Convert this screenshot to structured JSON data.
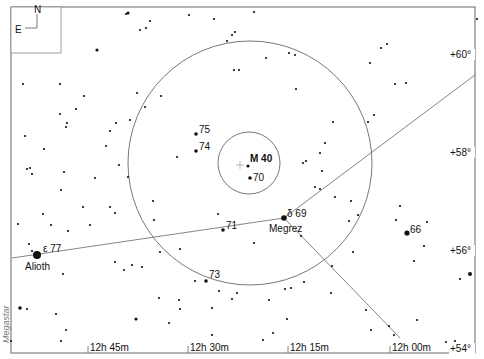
{
  "chart_data": {
    "type": "scatter",
    "compass": {
      "north": "N",
      "east": "E"
    },
    "ra_ticks": [
      {
        "label": "12h 45m",
        "x": 88
      },
      {
        "label": "12h 30m",
        "x": 188
      },
      {
        "label": "12h 15m",
        "x": 288
      },
      {
        "label": "12h 00m",
        "x": 390
      }
    ],
    "dec_ticks": [
      {
        "label": "+60°",
        "y": 55
      },
      {
        "label": "+58°",
        "y": 153
      },
      {
        "label": "+56°",
        "y": 251
      },
      {
        "label": "+54°",
        "y": 349
      }
    ],
    "fov_circles": [
      {
        "cx": 250,
        "cy": 163,
        "r": 122
      },
      {
        "cx": 249,
        "cy": 163,
        "r": 31
      }
    ],
    "center_marker": {
      "x": 240,
      "y": 165
    },
    "lines": [
      {
        "x1": 12,
        "y1": 258,
        "x2": 284,
        "y2": 218
      },
      {
        "x1": 284,
        "y1": 218,
        "x2": 475,
        "y2": 75
      },
      {
        "x1": 284,
        "y1": 218,
        "x2": 400,
        "y2": 338
      }
    ],
    "labeled_stars": [
      {
        "name": "M 40",
        "x": 248,
        "y": 166,
        "r": 1.6,
        "label_dx": 2,
        "label_dy": -4,
        "bold": true
      },
      {
        "name": "70",
        "x": 250,
        "y": 178,
        "r": 1.8,
        "label_dx": 3,
        "label_dy": 3
      },
      {
        "name": "75",
        "x": 196,
        "y": 134,
        "r": 1.8,
        "label_dx": 3,
        "label_dy": -1
      },
      {
        "name": "74",
        "x": 196,
        "y": 151,
        "r": 1.8,
        "label_dx": 3,
        "label_dy": -1
      },
      {
        "name": "δ 69",
        "x": 284,
        "y": 218,
        "r": 2.8,
        "label_dx": 3,
        "label_dy": -1
      },
      {
        "name": "Megrez",
        "x": 284,
        "y": 218,
        "r": 0,
        "label_dx": -15,
        "label_dy": 14
      },
      {
        "name": "71",
        "x": 223,
        "y": 230,
        "r": 1.8,
        "label_dx": 3,
        "label_dy": -1
      },
      {
        "name": "73",
        "x": 206,
        "y": 281,
        "r": 1.8,
        "label_dx": 3,
        "label_dy": -3
      },
      {
        "name": "66",
        "x": 407,
        "y": 233,
        "r": 2.6,
        "label_dx": 3,
        "label_dy": 0
      },
      {
        "name": "ε 77",
        "x": 37,
        "y": 255,
        "r": 4,
        "label_dx": 6,
        "label_dy": -3
      },
      {
        "name": "Alioth",
        "x": 37,
        "y": 255,
        "r": 0,
        "label_dx": -12,
        "label_dy": 15
      }
    ],
    "stars": [
      [
        126,
        14,
        1.1
      ],
      [
        128,
        13,
        1.6
      ],
      [
        150,
        21,
        1.1
      ],
      [
        140,
        30,
        1.1
      ],
      [
        146,
        28,
        1.1
      ],
      [
        189,
        15,
        1.1
      ],
      [
        214,
        19,
        1.1
      ],
      [
        254,
        12,
        1.1
      ],
      [
        227,
        41,
        1.1
      ],
      [
        232,
        35,
        1.1
      ],
      [
        235,
        32,
        1.1
      ],
      [
        234,
        70,
        1.1
      ],
      [
        239,
        70,
        1.1
      ],
      [
        266,
        58,
        1.1
      ],
      [
        289,
        53,
        1.1
      ],
      [
        295,
        55,
        1.1
      ],
      [
        296,
        89,
        1.1
      ],
      [
        381,
        48,
        1.1
      ],
      [
        387,
        44,
        1.1
      ],
      [
        370,
        63,
        1.1
      ],
      [
        395,
        84,
        1.1
      ],
      [
        406,
        83,
        1.1
      ],
      [
        97,
        50,
        1.6
      ],
      [
        23,
        84,
        1.1
      ],
      [
        60,
        84,
        1.1
      ],
      [
        84,
        96,
        1.1
      ],
      [
        76,
        109,
        1.1
      ],
      [
        60,
        114,
        1.1
      ],
      [
        67,
        123,
        1.1
      ],
      [
        66,
        127,
        1.1
      ],
      [
        25,
        136,
        1.1
      ],
      [
        44,
        149,
        1.1
      ],
      [
        106,
        146,
        1.1
      ],
      [
        110,
        131,
        1.1
      ],
      [
        116,
        123,
        1.1
      ],
      [
        130,
        120,
        1.1
      ],
      [
        145,
        107,
        1.1
      ],
      [
        137,
        93,
        1.1
      ],
      [
        161,
        96,
        1.1
      ],
      [
        27,
        169,
        1.1
      ],
      [
        30,
        168,
        1.1
      ],
      [
        32,
        174,
        1.1
      ],
      [
        64,
        172,
        1.1
      ],
      [
        95,
        178,
        1.1
      ],
      [
        61,
        190,
        1.1
      ],
      [
        119,
        165,
        1.1
      ],
      [
        128,
        177,
        1.1
      ],
      [
        43,
        214,
        1.1
      ],
      [
        83,
        207,
        1.1
      ],
      [
        110,
        207,
        1.1
      ],
      [
        115,
        213,
        1.1
      ],
      [
        153,
        201,
        1.1
      ],
      [
        177,
        157,
        1.1
      ],
      [
        154,
        220,
        1.1
      ],
      [
        18,
        224,
        1.1
      ],
      [
        51,
        225,
        1.1
      ],
      [
        90,
        225,
        1.1
      ],
      [
        63,
        274,
        1.1
      ],
      [
        68,
        231,
        1.1
      ],
      [
        29,
        244,
        1.1
      ],
      [
        32,
        251,
        1.1
      ],
      [
        115,
        262,
        1.1
      ],
      [
        124,
        270,
        1.1
      ],
      [
        132,
        265,
        1.1
      ],
      [
        142,
        267,
        1.1
      ],
      [
        160,
        252,
        1.1
      ],
      [
        180,
        249,
        1.1
      ],
      [
        179,
        300,
        1.1
      ],
      [
        218,
        214,
        1.1
      ],
      [
        195,
        281,
        1.1
      ],
      [
        237,
        293,
        1.1
      ],
      [
        254,
        243,
        1.1
      ],
      [
        232,
        299,
        1.1
      ],
      [
        301,
        236,
        1.1
      ],
      [
        304,
        282,
        1.1
      ],
      [
        285,
        289,
        1.1
      ],
      [
        291,
        288,
        1.1
      ],
      [
        287,
        319,
        1.1
      ],
      [
        269,
        300,
        1.1
      ],
      [
        331,
        293,
        1.1
      ],
      [
        368,
        122,
        1.1
      ],
      [
        374,
        115,
        1.1
      ],
      [
        333,
        122,
        1.1
      ],
      [
        325,
        143,
        1.1
      ],
      [
        320,
        153,
        1.1
      ],
      [
        306,
        161,
        1.1
      ],
      [
        303,
        163,
        1.1
      ],
      [
        322,
        171,
        1.1
      ],
      [
        315,
        187,
        1.1
      ],
      [
        320,
        189,
        1.1
      ],
      [
        335,
        197,
        1.1
      ],
      [
        351,
        201,
        1.1
      ],
      [
        349,
        221,
        1.1
      ],
      [
        358,
        215,
        1.1
      ],
      [
        353,
        252,
        1.1
      ],
      [
        332,
        266,
        1.1
      ],
      [
        400,
        206,
        1.1
      ],
      [
        396,
        220,
        1.1
      ],
      [
        427,
        222,
        1.1
      ],
      [
        424,
        246,
        1.1
      ],
      [
        414,
        261,
        1.1
      ],
      [
        470,
        274,
        2
      ],
      [
        460,
        279,
        1.1
      ],
      [
        417,
        320,
        1.1
      ],
      [
        446,
        342,
        1.1
      ],
      [
        455,
        341,
        1.1
      ],
      [
        389,
        326,
        1.1
      ],
      [
        394,
        335,
        1.1
      ],
      [
        366,
        310,
        1.1
      ],
      [
        371,
        330,
        1.1
      ],
      [
        20,
        308,
        1.8
      ],
      [
        27,
        309,
        1.1
      ],
      [
        56,
        314,
        1.1
      ],
      [
        66,
        330,
        1.1
      ],
      [
        61,
        341,
        1.1
      ],
      [
        11,
        341,
        1.1
      ],
      [
        136,
        319,
        1.6
      ],
      [
        159,
        298,
        1.1
      ],
      [
        169,
        323,
        1.1
      ],
      [
        180,
        309,
        1.1
      ],
      [
        212,
        308,
        1.1
      ],
      [
        212,
        335,
        1.1
      ],
      [
        219,
        291,
        1.1
      ],
      [
        263,
        340,
        1.1
      ],
      [
        273,
        333,
        1.1
      ],
      [
        477,
        19,
        1.1
      ]
    ]
  },
  "credit": "Megastar"
}
